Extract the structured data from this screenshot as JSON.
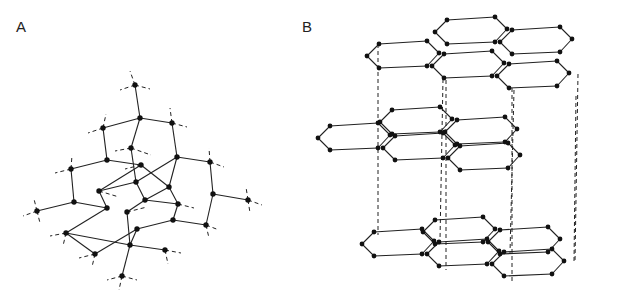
{
  "figure": {
    "panels": [
      {
        "id": "A",
        "label": "A",
        "description": "Tetrahedral network (diamond-like) lattice with atoms as black dots, solid bonds and dashed outward bond stubs"
      },
      {
        "id": "B",
        "label": "B",
        "description": "Stacked hexagonal layers (graphite/hexagonal ice-like) connected by dashed vertical lines"
      }
    ]
  },
  "panelA": {
    "label": "A",
    "atoms": [
      [
        135,
        85
      ],
      [
        140,
        118
      ],
      [
        103,
        128
      ],
      [
        172,
        123
      ],
      [
        131,
        148
      ],
      [
        107,
        160
      ],
      [
        177,
        157
      ],
      [
        210,
        162
      ],
      [
        71,
        169
      ],
      [
        141,
        165
      ],
      [
        136,
        182
      ],
      [
        99,
        191
      ],
      [
        169,
        187
      ],
      [
        74,
        202
      ],
      [
        37,
        211
      ],
      [
        107,
        208
      ],
      [
        145,
        200
      ],
      [
        178,
        204
      ],
      [
        127,
        212
      ],
      [
        213,
        194
      ],
      [
        248,
        200
      ],
      [
        173,
        220
      ],
      [
        137,
        229
      ],
      [
        206,
        225
      ],
      [
        66,
        233
      ],
      [
        130,
        245
      ],
      [
        165,
        250
      ],
      [
        95,
        254
      ],
      [
        122,
        276
      ]
    ],
    "bonds": [
      [
        0,
        1
      ],
      [
        1,
        2
      ],
      [
        1,
        3
      ],
      [
        1,
        4
      ],
      [
        2,
        5
      ],
      [
        3,
        6
      ],
      [
        5,
        8
      ],
      [
        5,
        9
      ],
      [
        6,
        7
      ],
      [
        6,
        10
      ],
      [
        4,
        10
      ],
      [
        9,
        11
      ],
      [
        9,
        12
      ],
      [
        6,
        12
      ],
      [
        8,
        13
      ],
      [
        13,
        14
      ],
      [
        13,
        15
      ],
      [
        15,
        11
      ],
      [
        11,
        10
      ],
      [
        10,
        16
      ],
      [
        16,
        17
      ],
      [
        12,
        17
      ],
      [
        12,
        16
      ],
      [
        7,
        19
      ],
      [
        19,
        20
      ],
      [
        19,
        23
      ],
      [
        17,
        21
      ],
      [
        21,
        22
      ],
      [
        21,
        23
      ],
      [
        16,
        18
      ],
      [
        18,
        25
      ],
      [
        15,
        24
      ],
      [
        24,
        25
      ],
      [
        22,
        25
      ],
      [
        25,
        26
      ],
      [
        22,
        27
      ],
      [
        25,
        28
      ],
      [
        27,
        24
      ]
    ],
    "stubs": [
      [
        0,
        -5,
        -14
      ],
      [
        0,
        -15,
        5
      ],
      [
        0,
        15,
        4
      ],
      [
        2,
        -15,
        5
      ],
      [
        2,
        3,
        -14
      ],
      [
        3,
        15,
        4
      ],
      [
        3,
        -2,
        -15
      ],
      [
        7,
        14,
        5
      ],
      [
        7,
        -1,
        -14
      ],
      [
        8,
        -16,
        4
      ],
      [
        8,
        1,
        -14
      ],
      [
        14,
        -14,
        5
      ],
      [
        14,
        3,
        12
      ],
      [
        14,
        -3,
        -12
      ],
      [
        20,
        14,
        5
      ],
      [
        20,
        2,
        13
      ],
      [
        20,
        -2,
        -13
      ],
      [
        23,
        13,
        5
      ],
      [
        23,
        3,
        13
      ],
      [
        26,
        16,
        3
      ],
      [
        26,
        3,
        14
      ],
      [
        27,
        -16,
        4
      ],
      [
        27,
        -3,
        13
      ],
      [
        28,
        -15,
        4
      ],
      [
        28,
        15,
        4
      ],
      [
        28,
        -3,
        14
      ],
      [
        4,
        20,
        7
      ],
      [
        4,
        -16,
        3
      ],
      [
        18,
        20,
        -5
      ],
      [
        24,
        -16,
        3
      ],
      [
        24,
        -3,
        13
      ],
      [
        9,
        -16,
        4
      ],
      [
        17,
        16,
        4
      ],
      [
        11,
        20,
        6
      ]
    ]
  },
  "panelB": {
    "label": "B",
    "layers": [
      {
        "offset_y": 0
      },
      {
        "offset_y": 100
      },
      {
        "offset_y": 182
      }
    ]
  }
}
